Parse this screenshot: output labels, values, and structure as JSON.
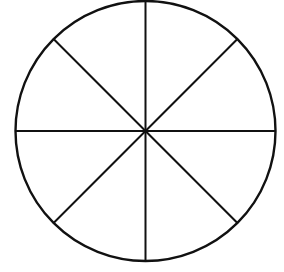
{
  "diagram": {
    "type": "circle-divided-into-sectors",
    "sectors": 8,
    "circle": {
      "cx": 145.5,
      "cy": 131,
      "r": 130
    },
    "stroke_color": "#111111",
    "background": "#ffffff",
    "lines": [
      {
        "name": "vertical-diameter",
        "angle_deg": 90
      },
      {
        "name": "horizontal-diameter",
        "angle_deg": 0
      },
      {
        "name": "diagonal-diameter-1",
        "angle_deg": 45
      },
      {
        "name": "diagonal-diameter-2",
        "angle_deg": 135
      }
    ]
  }
}
